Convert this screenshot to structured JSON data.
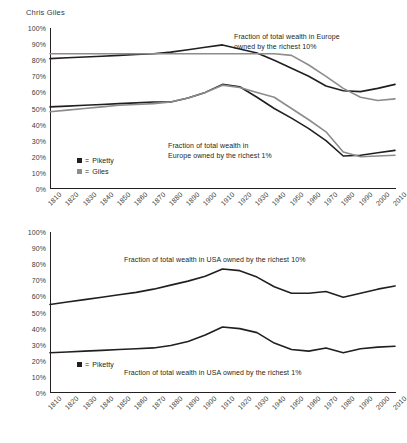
{
  "byline": "Chris Giles",
  "chart_data": [
    {
      "type": "line",
      "id": "europe",
      "title": "",
      "xlabel": "",
      "ylabel": "",
      "ylim": [
        0,
        100
      ],
      "ytick_labels": [
        "100%",
        "90%",
        "80%",
        "70%",
        "60%",
        "50%",
        "40%",
        "30%",
        "20%",
        "10%",
        "0%"
      ],
      "yticks": [
        100,
        90,
        80,
        70,
        60,
        50,
        40,
        30,
        20,
        10,
        0
      ],
      "grid": false,
      "legend_position": "inside-left",
      "x": [
        1810,
        1820,
        1830,
        1840,
        1850,
        1860,
        1870,
        1880,
        1890,
        1900,
        1910,
        1920,
        1930,
        1940,
        1950,
        1960,
        1970,
        1980,
        1990,
        2000,
        2010
      ],
      "xtick_labels": [
        "1810",
        "1820",
        "1830",
        "1840",
        "1850",
        "1860",
        "1870",
        "1880",
        "1890",
        "1900",
        "1910",
        "1920",
        "1930",
        "1940",
        "1950",
        "1960",
        "1970",
        "1980",
        "1990",
        "2000",
        "2010"
      ],
      "series": [
        {
          "name": "Piketty",
          "color": "#231f20",
          "subset": "richest 10%",
          "values": [
            81,
            81.5,
            82,
            82.5,
            83,
            83.5,
            84,
            85,
            86.5,
            88,
            89.5,
            87,
            84.5,
            80,
            75,
            70,
            64,
            61,
            60.5,
            62.5,
            65
          ]
        },
        {
          "name": "Giles",
          "color": "#8c8c8c",
          "subset": "richest 10%",
          "values": [
            84,
            84,
            84,
            84,
            84,
            84,
            84,
            84,
            84,
            84,
            84,
            84,
            84,
            84,
            83,
            77,
            70,
            62.5,
            57,
            55,
            56
          ]
        },
        {
          "name": "Piketty",
          "color": "#231f20",
          "subset": "richest 1%",
          "values": [
            51,
            51.5,
            52,
            52.5,
            53,
            53.5,
            54,
            54,
            56.5,
            60,
            65,
            63.5,
            57,
            50,
            44,
            37.5,
            30,
            20.5,
            21,
            22.5,
            24
          ]
        },
        {
          "name": "Giles",
          "color": "#8c8c8c",
          "subset": "richest 1%",
          "values": [
            48,
            49,
            50,
            51,
            52,
            52.5,
            53,
            54,
            56.5,
            60,
            64.5,
            63,
            60,
            57,
            50,
            43,
            35.5,
            23,
            20,
            20.5,
            21
          ]
        }
      ],
      "annotations": [
        {
          "id": "europe-top-anno",
          "text": "Fraction of total wealth in Europe\nowned by the richest 10%"
        },
        {
          "id": "europe-bottom-anno",
          "text": "Fraction of total wealth in\nEurope owned by the richest 1%"
        }
      ],
      "legend": [
        {
          "marker": "black-square",
          "eq": "=",
          "label": "Piketty",
          "color": "#231f20"
        },
        {
          "marker": "gray-square",
          "eq": "=",
          "label": "Giles",
          "color": "#8c8c8c"
        }
      ]
    },
    {
      "type": "line",
      "id": "usa",
      "title": "",
      "xlabel": "",
      "ylabel": "",
      "ylim": [
        0,
        100
      ],
      "ytick_labels": [
        "100%",
        "90%",
        "80%",
        "70%",
        "60%",
        "50%",
        "40%",
        "30%",
        "20%",
        "10%",
        "0%"
      ],
      "yticks": [
        100,
        90,
        80,
        70,
        60,
        50,
        40,
        30,
        20,
        10,
        0
      ],
      "grid": false,
      "legend_position": "inside-left",
      "x": [
        1810,
        1820,
        1830,
        1840,
        1850,
        1860,
        1870,
        1880,
        1890,
        1900,
        1910,
        1920,
        1930,
        1940,
        1950,
        1960,
        1970,
        1980,
        1990,
        2000,
        2010
      ],
      "xtick_labels": [
        "1810",
        "1820",
        "1830",
        "1840",
        "1850",
        "1860",
        "1870",
        "1880",
        "1890",
        "1900",
        "1910",
        "1920",
        "1930",
        "1940",
        "1950",
        "1960",
        "1970",
        "1980",
        "1990",
        "2000",
        "2010"
      ],
      "series": [
        {
          "name": "Piketty",
          "color": "#231f20",
          "subset": "richest 10%",
          "values": [
            55,
            56.5,
            58,
            59.5,
            61,
            62.5,
            64.5,
            67,
            69.5,
            72.5,
            77,
            76,
            72,
            66,
            62,
            62,
            63,
            59.5,
            62,
            64.5,
            66.5
          ]
        },
        {
          "name": "Piketty",
          "color": "#231f20",
          "subset": "richest 1%",
          "values": [
            25,
            25.5,
            26,
            26.5,
            27,
            27.5,
            28,
            29.5,
            32,
            36,
            41,
            40,
            37.5,
            31,
            27,
            26,
            28,
            25,
            27.5,
            28.5,
            29
          ]
        }
      ],
      "annotations": [
        {
          "id": "usa-top-anno",
          "text": "Fraction of total wealth in USA owned by the richest 10%"
        },
        {
          "id": "usa-bottom-anno",
          "text": "Fraction of total wealth in USA owned by the richest 1%"
        }
      ],
      "legend": [
        {
          "marker": "black-square",
          "eq": "=",
          "label": "Piketty",
          "color": "#231f20"
        }
      ]
    }
  ]
}
